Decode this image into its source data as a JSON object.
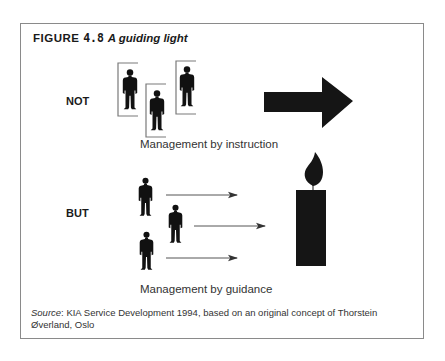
{
  "figure": {
    "label": "FIGURE",
    "number": "4.8",
    "title": "A guiding light"
  },
  "rows": [
    {
      "label": "NOT",
      "caption": "Management by instruction",
      "symbol": "arrow-right",
      "figures": 3,
      "figure_style": "boxed-people"
    },
    {
      "label": "BUT",
      "caption": "Management by guidance",
      "symbol": "candle",
      "figures": 3,
      "figure_style": "people-with-arrows"
    }
  ],
  "source": {
    "prefix": "Source",
    "text": ": KIA Service Development 1994, based on an original concept of Thorstein Øverland, Oslo"
  },
  "colors": {
    "ink": "#111111",
    "frame": "#8a8a8a",
    "bracket": "#7a7a7a",
    "thin_arrow": "#555555"
  }
}
